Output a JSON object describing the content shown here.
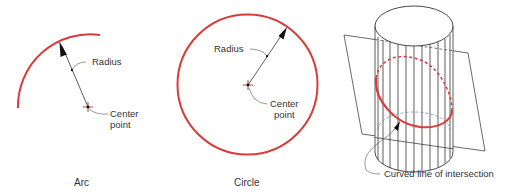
{
  "colors": {
    "curve": "#d93a3a",
    "line": "#333333",
    "text": "#333333",
    "dashed_back": "#6a8a9a"
  },
  "panels": [
    {
      "id": "arc",
      "caption": "Arc",
      "labels": {
        "radius": "Radius",
        "center_line1": "Center",
        "center_line2": "point"
      }
    },
    {
      "id": "circle",
      "caption": "Circle",
      "labels": {
        "radius": "Radius",
        "center_line1": "Center",
        "center_line2": "point"
      }
    },
    {
      "id": "cylinder",
      "caption": "",
      "labels": {
        "intersection": "Curved line of intersection"
      }
    }
  ]
}
